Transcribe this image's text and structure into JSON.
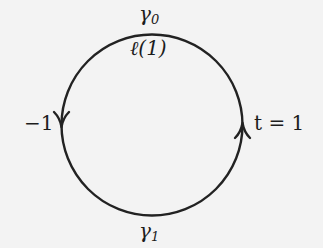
{
  "diagram": {
    "type": "oriented-circle-loop",
    "circle": {
      "center": [
        152,
        125
      ],
      "radius": 90.5,
      "stroke_color": "#222222"
    },
    "arrows": [
      {
        "position": "left",
        "direction": "down"
      },
      {
        "position": "right",
        "direction": "up"
      }
    ],
    "labels": {
      "gamma0": {
        "symbol": "γ",
        "subscript": "0"
      },
      "ell": "ℓ(1)",
      "left_point": "−1",
      "right_point": "t = 1",
      "gamma1": {
        "symbol": "γ",
        "subscript": "1"
      }
    }
  },
  "colors": {
    "background": "#f3f3f3",
    "ink": "#1c1c1c"
  }
}
